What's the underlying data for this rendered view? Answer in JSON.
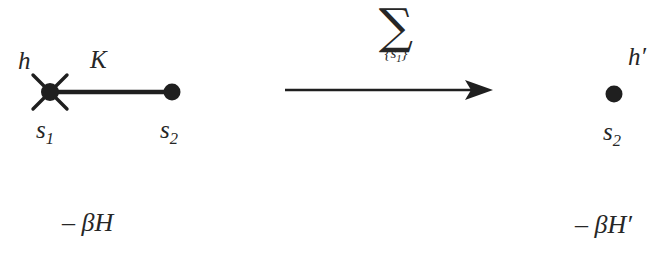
{
  "figure": {
    "background_color": "#ffffff",
    "ink_color": "#262626",
    "left_lattice": {
      "field_label": "h",
      "coupling_label": "K",
      "site_1_label": "s",
      "site_1_index": "1",
      "site_2_label": "s",
      "site_2_index": "2",
      "hamiltonian": "– βH"
    },
    "operation": {
      "sum_glyph": "∑",
      "sum_index_open": "{",
      "sum_index_label": "s",
      "sum_index_sub": "1",
      "sum_index_close": "}",
      "arrow_name": "rightwards-arrow"
    },
    "right_lattice": {
      "field_label": "h′",
      "site_2_label": "s",
      "site_2_index": "2",
      "hamiltonian": "– βH′"
    }
  }
}
